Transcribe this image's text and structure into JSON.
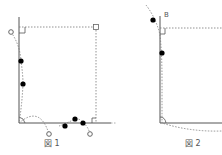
{
  "figures": [
    {
      "caption": "図 1",
      "labels": []
    },
    {
      "caption": "図 2",
      "labels": [
        "B"
      ]
    }
  ],
  "colors": {
    "line": "#555555",
    "dashed": "#777777",
    "dot": "#000000",
    "open_circle": "#666666"
  }
}
